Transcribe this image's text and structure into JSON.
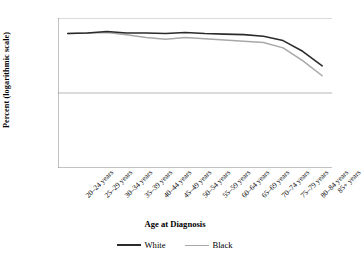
{
  "chart_data": {
    "type": "line",
    "title": "",
    "xlabel": "Age at Diagnosis",
    "ylabel": "Percent (logarithmic scale)",
    "yscale": "log",
    "ylim": [
      1,
      100
    ],
    "yticks": [
      1,
      10,
      100
    ],
    "ytick_labels": [
      "1",
      "10",
      "100"
    ],
    "grid": true,
    "legend_position": "bottom",
    "categories": [
      "20–24 years",
      "25–29 years",
      "30–34 years",
      "35–39 years",
      "40–44 years",
      "45–49 years",
      "50–54 years",
      "55–59 years",
      "60–64 years",
      "65–69 years",
      "70–74 years",
      "75–79 years",
      "80–84 years",
      "85+ years"
    ],
    "series": [
      {
        "name": "White",
        "color": "#2b2b2b",
        "width": 1.6,
        "values": [
          62,
          63,
          66,
          63,
          63,
          62,
          64,
          62,
          61,
          60,
          57,
          50,
          36,
          23
        ]
      },
      {
        "name": "Black",
        "color": "#a8a8a8",
        "width": 1.5,
        "values": [
          62,
          63,
          64,
          60,
          55,
          52,
          55,
          53,
          51,
          49,
          47,
          40,
          27,
          17
        ]
      }
    ]
  },
  "legend": {
    "items": [
      {
        "label": "White",
        "color": "#2b2b2b"
      },
      {
        "label": "Black",
        "color": "#a8a8a8"
      }
    ]
  },
  "axes": {
    "y_title": "Percent (logarithmic scale)",
    "x_title": "Age at Diagnosis"
  }
}
